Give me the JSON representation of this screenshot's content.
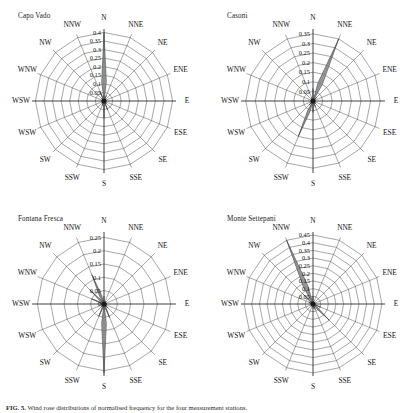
{
  "figure": {
    "caption_label": "FIG. 5.",
    "caption_text": "Wind rose distributions of normalised frequency for the four measurement stations."
  },
  "common": {
    "directions": [
      "N",
      "NNE",
      "NE",
      "ENE",
      "E",
      "ESE",
      "SE",
      "SSE",
      "S",
      "SSW",
      "WSW",
      "WSW",
      "WNW",
      "NW",
      "NNW"
    ],
    "direction_count_note": "16 compass sectors drawn; two западward labels both rendered as WSW in source image"
  },
  "panels": [
    {
      "id": "capo-vado",
      "title": "Capo Vado",
      "tick_labels": [
        "0.4",
        "0.35",
        "0.3",
        "0.25",
        "0.2",
        "0.15",
        "0.1",
        "0.05"
      ],
      "rmax": 0.42,
      "ring_values": [
        0.05,
        0.1,
        0.15,
        0.2,
        0.25,
        0.3,
        0.35,
        0.4
      ],
      "labels_all": [
        "N",
        "NNE",
        "NE",
        "ENE",
        "E",
        "ESE",
        "SE",
        "SSE",
        "S",
        "SSW",
        "WSW",
        "WSW",
        "WNW",
        "NW",
        "NNW"
      ],
      "chart_data": {
        "type": "bar",
        "subtype": "wind-rose",
        "title": "Capo Vado",
        "xlabel": "",
        "ylabel": "normalised frequency",
        "categories": [
          "N",
          "NNE",
          "NE",
          "ENE",
          "E",
          "ESE",
          "SE",
          "SSE",
          "S",
          "SSW",
          "SW",
          "WSW",
          "W",
          "WNW",
          "NW",
          "NNW"
        ],
        "values": [
          0.4,
          0.035,
          0.012,
          0.01,
          0.01,
          0.012,
          0.02,
          0.055,
          0.1,
          0.03,
          0.012,
          0.01,
          0.01,
          0.012,
          0.02,
          0.06
        ],
        "ylim": [
          0,
          0.42
        ],
        "grid": true,
        "legend": "none"
      }
    },
    {
      "id": "casoni",
      "title": "Casoni",
      "tick_labels": [
        "0.35",
        "0.3",
        "0.25",
        "0.2",
        "0.15",
        "0.1",
        "0.05"
      ],
      "rmax": 0.375,
      "ring_values": [
        0.05,
        0.1,
        0.15,
        0.2,
        0.25,
        0.3,
        0.35
      ],
      "labels_all": [
        "N",
        "NNE",
        "NE",
        "ENE",
        "E",
        "ESE",
        "SE",
        "SSE",
        "S",
        "SSW",
        "WSW",
        "WSW",
        "WNW",
        "NW",
        "NNW"
      ],
      "chart_data": {
        "type": "bar",
        "subtype": "wind-rose",
        "title": "Casoni",
        "xlabel": "",
        "ylabel": "normalised frequency",
        "categories": [
          "N",
          "NNE",
          "NE",
          "ENE",
          "E",
          "ESE",
          "SE",
          "SSE",
          "S",
          "SSW",
          "SW",
          "WSW",
          "W",
          "WNW",
          "NW",
          "NNW"
        ],
        "values": [
          0.065,
          0.35,
          0.03,
          0.012,
          0.01,
          0.012,
          0.02,
          0.035,
          0.06,
          0.2,
          0.03,
          0.012,
          0.01,
          0.01,
          0.012,
          0.02
        ],
        "ylim": [
          0,
          0.375
        ],
        "grid": true,
        "legend": "none"
      }
    },
    {
      "id": "fontana-fresca",
      "title": "Fontana Fresca",
      "tick_labels": [
        "0.25",
        "0.2",
        "0.15",
        "0.1",
        "0.05",
        "0"
      ],
      "rmax": 0.27,
      "ring_values": [
        0.05,
        0.1,
        0.15,
        0.2,
        0.25
      ],
      "labels_all": [
        "N",
        "NNE",
        "NE",
        "ENE",
        "E",
        "ESE",
        "SE",
        "SSE",
        "S",
        "SSW",
        "WSW",
        "WSW",
        "WNW",
        "NW",
        "NNW"
      ],
      "chart_data": {
        "type": "bar",
        "subtype": "wind-rose",
        "title": "Fontana Fresca",
        "xlabel": "",
        "ylabel": "normalised frequency",
        "categories": [
          "N",
          "NNE",
          "NE",
          "ENE",
          "E",
          "ESE",
          "SE",
          "SSE",
          "S",
          "SSW",
          "SW",
          "WSW",
          "W",
          "WNW",
          "NW",
          "NNW"
        ],
        "values": [
          0.03,
          0.012,
          0.01,
          0.008,
          0.01,
          0.012,
          0.02,
          0.055,
          0.26,
          0.05,
          0.015,
          0.01,
          0.01,
          0.05,
          0.075,
          0.12
        ],
        "ylim": [
          0,
          0.27
        ],
        "grid": true,
        "legend": "none"
      }
    },
    {
      "id": "monte-settepani",
      "title": "Monte Settepani",
      "tick_labels": [
        "0.45",
        "0.4",
        "0.35",
        "0.3",
        "0.25",
        "0.2",
        "0.15",
        "0.1",
        "0.05"
      ],
      "rmax": 0.47,
      "ring_values": [
        0.05,
        0.1,
        0.15,
        0.2,
        0.25,
        0.3,
        0.35,
        0.4,
        0.45
      ],
      "labels_all": [
        "N",
        "NNE",
        "NE",
        "ENE",
        "E",
        "ESE",
        "SE",
        "SSE",
        "S",
        "SSW",
        "WSW",
        "WSW",
        "WNW",
        "NW",
        "NNW"
      ],
      "chart_data": {
        "type": "bar",
        "subtype": "wind-rose",
        "title": "Monte Settepani",
        "xlabel": "",
        "ylabel": "normalised frequency",
        "categories": [
          "N",
          "NNE",
          "NE",
          "ENE",
          "E",
          "ESE",
          "SE",
          "SSE",
          "S",
          "SSW",
          "SW",
          "WSW",
          "W",
          "WNW",
          "NW",
          "NNW"
        ],
        "values": [
          0.05,
          0.015,
          0.01,
          0.008,
          0.01,
          0.055,
          0.15,
          0.04,
          0.03,
          0.012,
          0.01,
          0.008,
          0.01,
          0.03,
          0.09,
          0.45
        ],
        "ylim": [
          0,
          0.47
        ],
        "grid": true,
        "legend": "none"
      }
    }
  ]
}
